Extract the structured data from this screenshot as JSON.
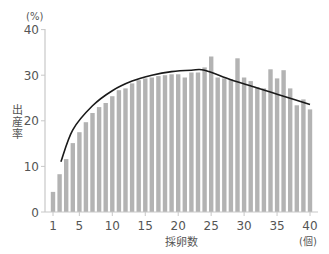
{
  "chart_data": {
    "type": "bar",
    "title": "",
    "xlabel": "採卵数",
    "x_unit": "(個)",
    "ylabel": "出産率",
    "y_unit": "(%)",
    "ylim": [
      0,
      40
    ],
    "xlim": [
      1,
      40
    ],
    "yticks": [
      0,
      10,
      20,
      30,
      40
    ],
    "xticks": [
      1,
      5,
      10,
      15,
      20,
      25,
      30,
      35,
      40
    ],
    "grid": false,
    "legend": null,
    "bar_color": "#b3b3b3",
    "categories": [
      1,
      2,
      3,
      4,
      5,
      6,
      7,
      8,
      9,
      10,
      11,
      12,
      13,
      14,
      15,
      16,
      17,
      18,
      19,
      20,
      21,
      22,
      23,
      24,
      25,
      26,
      27,
      28,
      29,
      30,
      31,
      32,
      33,
      34,
      35,
      36,
      37,
      38,
      39,
      40
    ],
    "series": [
      {
        "name": "出産率",
        "type": "bar",
        "values": [
          4.4,
          8.3,
          11.6,
          15.1,
          17.5,
          19.7,
          21.7,
          23.0,
          23.9,
          25.4,
          26.7,
          27.1,
          28.2,
          28.9,
          29.3,
          29.5,
          29.8,
          30.0,
          30.2,
          30.2,
          29.5,
          30.6,
          30.6,
          31.7,
          34.1,
          29.5,
          29.3,
          29.1,
          33.7,
          29.5,
          28.7,
          27.4,
          27.1,
          31.3,
          29.3,
          31.1,
          27.1,
          23.4,
          24.7,
          22.5
        ]
      },
      {
        "name": "trend",
        "type": "line",
        "color": "#1a1a1a",
        "points": [
          [
            2.2,
            11.0
          ],
          [
            4,
            18.0
          ],
          [
            7,
            23.3
          ],
          [
            10,
            26.6
          ],
          [
            13,
            28.7
          ],
          [
            16,
            30.0
          ],
          [
            19,
            30.8
          ],
          [
            22,
            31.1
          ],
          [
            24,
            31.1
          ],
          [
            28,
            29.0
          ],
          [
            32,
            27.2
          ],
          [
            36,
            25.4
          ],
          [
            40,
            23.6
          ]
        ]
      }
    ]
  }
}
